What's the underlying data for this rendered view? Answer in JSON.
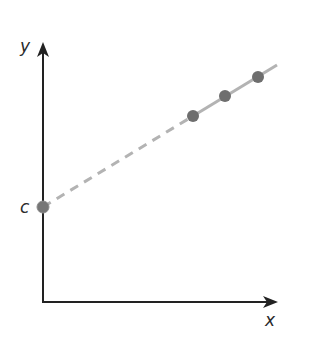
{
  "diagram": {
    "type": "line-graph-sketch",
    "axes": {
      "x_label": "x",
      "y_label": "y",
      "intercept_label": "c",
      "axis_color": "#222222"
    },
    "line": {
      "color": "#b3b3b3",
      "solid_segment": "through data points",
      "dashed_segment": "extrapolation back to y-intercept"
    },
    "points": {
      "color": "#707070",
      "data_points": [
        {
          "px": 193,
          "py": 116
        },
        {
          "px": 225,
          "py": 96
        },
        {
          "px": 258,
          "py": 77
        }
      ],
      "intercept_point": {
        "px": 43,
        "py": 207
      }
    }
  }
}
